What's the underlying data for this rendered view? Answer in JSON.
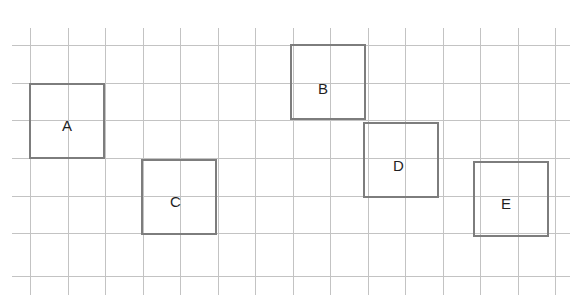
{
  "figure": {
    "width": 575,
    "height": 307,
    "background_color": "#ffffff"
  },
  "grid": {
    "line_color": "#c3c3c3",
    "line_width": 1,
    "cell_size": 37.5,
    "vertical_x": [
      30,
      68,
      105,
      143,
      180,
      218,
      255,
      293,
      330,
      368,
      405,
      443,
      480,
      518,
      555
    ],
    "vertical_span": {
      "top": 28,
      "bottom": 295
    },
    "horizontal_y": [
      45,
      83,
      120,
      158,
      196,
      233,
      276
    ],
    "horizontal_span": {
      "left": 12,
      "right": 570
    }
  },
  "squares": {
    "border_color": "#7d7d7d",
    "border_width": 2,
    "label_color": "#1f1f1f",
    "items": [
      {
        "label": "A",
        "x": 29,
        "y": 83,
        "size": 76,
        "grid_cells_wide": 2,
        "grid_cells_tall": 2,
        "label_x": 62,
        "label_y": 118
      },
      {
        "label": "B",
        "x": 290,
        "y": 44,
        "size": 76,
        "grid_cells_wide": 2,
        "grid_cells_tall": 2,
        "label_x": 318,
        "label_y": 81
      },
      {
        "label": "C",
        "x": 141,
        "y": 159,
        "size": 76,
        "grid_cells_wide": 2,
        "grid_cells_tall": 2,
        "label_x": 170,
        "label_y": 194
      },
      {
        "label": "D",
        "x": 363,
        "y": 122,
        "size": 76,
        "grid_cells_wide": 2,
        "grid_cells_tall": 2,
        "label_x": 393,
        "label_y": 158
      },
      {
        "label": "E",
        "x": 473,
        "y": 161,
        "size": 76,
        "grid_cells_wide": 2,
        "grid_cells_tall": 2,
        "label_x": 501,
        "label_y": 196
      }
    ]
  }
}
